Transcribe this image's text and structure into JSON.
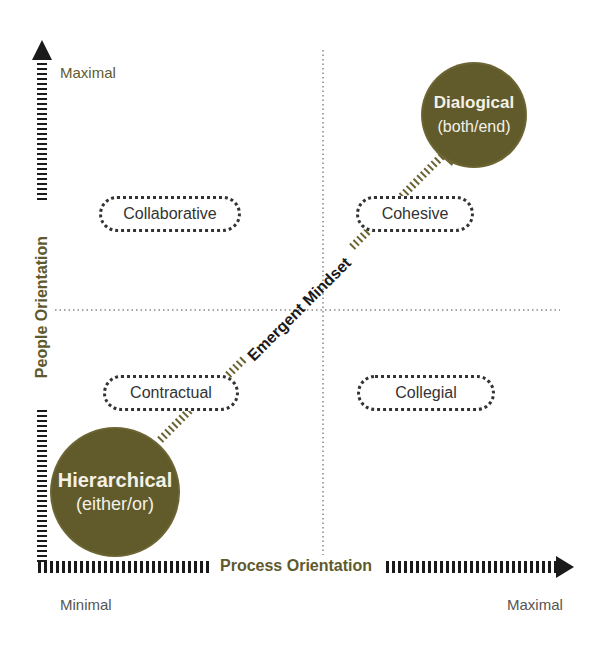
{
  "diagram": {
    "y_axis": {
      "label": "People Orientation",
      "max_label": "Maximal"
    },
    "x_axis": {
      "label": "Process Orientation",
      "min_label": "Minimal",
      "max_label": "Maximal"
    },
    "quadrants": {
      "top_left": "Collaborative",
      "top_right": "Cohesive",
      "bottom_left": "Contractual",
      "bottom_right": "Collegial"
    },
    "start_node": {
      "title": "Hierarchical",
      "subtitle": "(either/or)"
    },
    "end_node": {
      "title": "Dialogical",
      "subtitle": "(both/end)"
    },
    "arrow_label": "Emergent Mindset"
  },
  "colors": {
    "accent": "#615a2b",
    "axis": "#1a1a1a",
    "label": "#5f5a2e"
  }
}
